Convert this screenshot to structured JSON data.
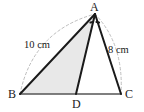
{
  "figure": {
    "type": "geometry-diagram",
    "shape": "triangle-with-cevian",
    "background_color": "#ffffff",
    "stroke_color": "#1a1a1a",
    "shaded_fill_color": "#e8e8e8",
    "dashed_arc_color": "#bdbdbd",
    "vertices": {
      "A": {
        "label": "A",
        "x": 95,
        "y": 14
      },
      "B": {
        "label": "B",
        "x": 20,
        "y": 94
      },
      "C": {
        "label": "C",
        "x": 121,
        "y": 94
      },
      "D": {
        "label": "D",
        "x": 76,
        "y": 94
      }
    },
    "side_labels": {
      "ab": "10 cm",
      "ac": "8 cm"
    },
    "angle_marks": {
      "at_vertex": "A",
      "count": 2,
      "meaning": "equal-angles-bisector"
    },
    "shaded_region": "triangle ABD",
    "segments": [
      {
        "name": "AB",
        "from": "A",
        "to": "B"
      },
      {
        "name": "AC",
        "from": "A",
        "to": "C"
      },
      {
        "name": "BC",
        "from": "B",
        "to": "C"
      },
      {
        "name": "AD",
        "from": "A",
        "to": "D"
      }
    ],
    "dashed_arcs": [
      {
        "name": "arc-B-to-A",
        "from": "B",
        "to": "A"
      },
      {
        "name": "arc-A-to-C",
        "from": "A",
        "to": "C"
      }
    ]
  }
}
